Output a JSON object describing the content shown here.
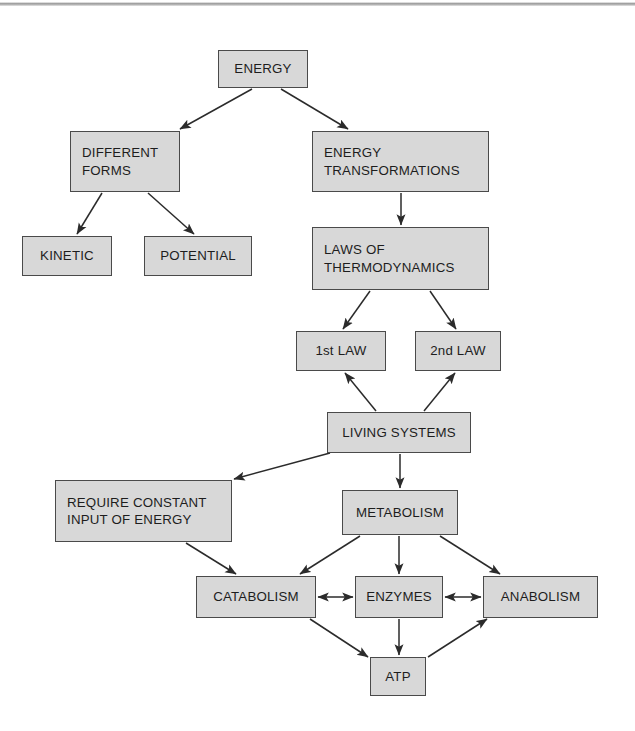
{
  "diagram": {
    "background_color": "#ffffff",
    "node_fill_color": "#d8d8d8",
    "node_border_color": "#4a4a4a",
    "text_color": "#1d1d1d",
    "scan_edge_color": "#9a9a9a",
    "nodes": [
      {
        "id": "energy",
        "label": "ENERGY",
        "x": 218,
        "y": 50,
        "w": 90,
        "h": 38,
        "align": "center"
      },
      {
        "id": "different",
        "label": "DIFFERENT\nFORMS",
        "x": 70,
        "y": 131,
        "w": 110,
        "h": 61,
        "align": "left"
      },
      {
        "id": "transform",
        "label": "ENERGY\nTRANSFORMATIONS",
        "x": 312,
        "y": 131,
        "w": 177,
        "h": 61,
        "align": "left"
      },
      {
        "id": "kinetic",
        "label": "KINETIC",
        "x": 22,
        "y": 236,
        "w": 90,
        "h": 40,
        "align": "center"
      },
      {
        "id": "potential",
        "label": "POTENTIAL",
        "x": 144,
        "y": 236,
        "w": 108,
        "h": 40,
        "align": "center"
      },
      {
        "id": "laws",
        "label": "LAWS OF\nTHERMODYNAMICS",
        "x": 312,
        "y": 227,
        "w": 177,
        "h": 63,
        "align": "left"
      },
      {
        "id": "law1",
        "label": "1st LAW",
        "x": 296,
        "y": 331,
        "w": 90,
        "h": 40,
        "align": "center"
      },
      {
        "id": "law2",
        "label": "2nd LAW",
        "x": 415,
        "y": 331,
        "w": 86,
        "h": 40,
        "align": "center"
      },
      {
        "id": "living",
        "label": "LIVING SYSTEMS",
        "x": 327,
        "y": 412,
        "w": 144,
        "h": 41,
        "align": "center"
      },
      {
        "id": "require",
        "label": "REQUIRE CONSTANT\nINPUT OF ENERGY",
        "x": 55,
        "y": 480,
        "w": 177,
        "h": 62,
        "align": "left"
      },
      {
        "id": "metabolism",
        "label": "METABOLISM",
        "x": 342,
        "y": 490,
        "w": 116,
        "h": 45,
        "align": "center"
      },
      {
        "id": "catabolism",
        "label": "CATABOLISM",
        "x": 196,
        "y": 576,
        "w": 120,
        "h": 42,
        "align": "center"
      },
      {
        "id": "enzymes",
        "label": "ENZYMES",
        "x": 355,
        "y": 576,
        "w": 88,
        "h": 42,
        "align": "center"
      },
      {
        "id": "anabolism",
        "label": "ANABOLISM",
        "x": 483,
        "y": 576,
        "w": 115,
        "h": 42,
        "align": "center"
      },
      {
        "id": "atp",
        "label": "ATP",
        "x": 370,
        "y": 657,
        "w": 56,
        "h": 39,
        "align": "center"
      }
    ],
    "edges": [
      {
        "from": "energy",
        "to": "different",
        "x1": 252,
        "y1": 89,
        "x2": 180,
        "y2": 129,
        "arrow": "end"
      },
      {
        "from": "energy",
        "to": "transform",
        "x1": 281,
        "y1": 89,
        "x2": 348,
        "y2": 129,
        "arrow": "end"
      },
      {
        "from": "different",
        "to": "kinetic",
        "x1": 102,
        "y1": 193,
        "x2": 77,
        "y2": 234,
        "arrow": "end"
      },
      {
        "from": "different",
        "to": "potential",
        "x1": 148,
        "y1": 193,
        "x2": 194,
        "y2": 234,
        "arrow": "end"
      },
      {
        "from": "transform",
        "to": "laws",
        "x1": 401,
        "y1": 193,
        "x2": 401,
        "y2": 225,
        "arrow": "end"
      },
      {
        "from": "laws",
        "to": "law1",
        "x1": 370,
        "y1": 291,
        "x2": 343,
        "y2": 329,
        "arrow": "end"
      },
      {
        "from": "laws",
        "to": "law2",
        "x1": 430,
        "y1": 291,
        "x2": 456,
        "y2": 329,
        "arrow": "end"
      },
      {
        "from": "living",
        "to": "law1",
        "x1": 376,
        "y1": 411,
        "x2": 345,
        "y2": 373,
        "arrow": "end"
      },
      {
        "from": "living",
        "to": "law2",
        "x1": 424,
        "y1": 411,
        "x2": 455,
        "y2": 373,
        "arrow": "end"
      },
      {
        "from": "living",
        "to": "require",
        "x1": 330,
        "y1": 453,
        "x2": 234,
        "y2": 479,
        "arrow": "end"
      },
      {
        "from": "living",
        "to": "metabolism",
        "x1": 400,
        "y1": 454,
        "x2": 400,
        "y2": 488,
        "arrow": "end"
      },
      {
        "from": "require",
        "to": "catabolism",
        "x1": 186,
        "y1": 543,
        "x2": 236,
        "y2": 574,
        "arrow": "end"
      },
      {
        "from": "metabolism",
        "to": "catabolism",
        "x1": 360,
        "y1": 536,
        "x2": 300,
        "y2": 574,
        "arrow": "end"
      },
      {
        "from": "metabolism",
        "to": "enzymes",
        "x1": 399,
        "y1": 536,
        "x2": 399,
        "y2": 574,
        "arrow": "end"
      },
      {
        "from": "metabolism",
        "to": "anabolism",
        "x1": 440,
        "y1": 536,
        "x2": 500,
        "y2": 574,
        "arrow": "end"
      },
      {
        "from": "catabolism",
        "to": "enzymes",
        "x1": 318,
        "y1": 597,
        "x2": 353,
        "y2": 597,
        "arrow": "both"
      },
      {
        "from": "enzymes",
        "to": "anabolism",
        "x1": 445,
        "y1": 597,
        "x2": 481,
        "y2": 597,
        "arrow": "both"
      },
      {
        "from": "catabolism",
        "to": "atp",
        "x1": 310,
        "y1": 619,
        "x2": 368,
        "y2": 657,
        "arrow": "end"
      },
      {
        "from": "enzymes",
        "to": "atp",
        "x1": 399,
        "y1": 619,
        "x2": 399,
        "y2": 655,
        "arrow": "end"
      },
      {
        "from": "atp",
        "to": "anabolism",
        "x1": 428,
        "y1": 657,
        "x2": 487,
        "y2": 619,
        "arrow": "end"
      }
    ]
  }
}
